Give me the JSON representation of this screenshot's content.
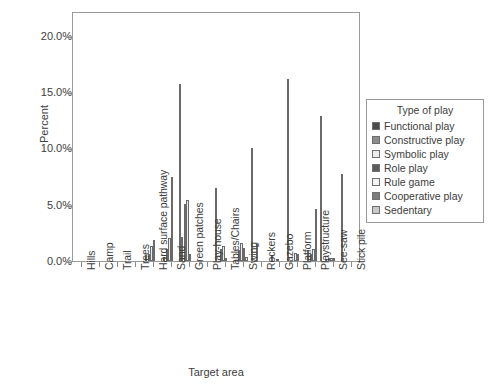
{
  "chart_data": {
    "type": "bar",
    "title": "",
    "xlabel": "Target area",
    "ylabel": "Percent",
    "ylim": [
      0,
      22.2
    ],
    "ytick_values": [
      0,
      5,
      10,
      15,
      20
    ],
    "ytick_labels": [
      "0.0%",
      "5.0%",
      "10.0%",
      "15.0%",
      "20.0%"
    ],
    "grid": false,
    "legend_position": "right-outside",
    "legend_title": "Type of play",
    "categories": [
      "Hills",
      "Camp",
      "Trail",
      "Trees",
      "Hard surface pathway",
      "Sand",
      "Green patches",
      "Play-house",
      "Tables/Chairs",
      "Swing",
      "Rockers",
      "Gazebo",
      "Platform",
      "Playstructure",
      "See-saw",
      "Stick pile"
    ],
    "series": [
      {
        "name": "Functional play",
        "color": "#4b4b4b",
        "values": [
          0,
          0,
          0,
          0,
          0.5,
          0.4,
          2.1,
          0,
          0,
          0,
          0,
          0.5,
          0,
          1.0,
          0.2,
          0
        ]
      },
      {
        "name": "Constructive play",
        "color": "#8c8c8c",
        "values": [
          0,
          0,
          0,
          0,
          0.6,
          1.1,
          5.1,
          0,
          1.1,
          1.0,
          1.5,
          0,
          0,
          0.6,
          0.3,
          0
        ]
      },
      {
        "name": "Symbolic play",
        "color": "#ededed",
        "values": [
          0,
          0,
          0,
          0,
          1.3,
          2.0,
          5.4,
          0,
          1.3,
          1.6,
          0,
          0.1,
          0.7,
          1.1,
          0.3,
          0
        ]
      },
      {
        "name": "Role play",
        "color": "#5a5a5a",
        "values": [
          0,
          0,
          0,
          0,
          1.9,
          7.5,
          0.6,
          0,
          0.3,
          1.2,
          0,
          0,
          0.6,
          4.6,
          0.3,
          0
        ]
      },
      {
        "name": "Rule game",
        "color": "#f4f4f4",
        "values": [
          0,
          0,
          0,
          0,
          0,
          0,
          0,
          0,
          0,
          0.4,
          0,
          0,
          0,
          0,
          0,
          0
        ]
      },
      {
        "name": "Cooperative play",
        "color": "#7d7d7d",
        "values": [
          0,
          0,
          0,
          0,
          0,
          0,
          0,
          0,
          0,
          0,
          0,
          0,
          0,
          12.9,
          0,
          0
        ]
      },
      {
        "name": "Sedentary",
        "color": "#c9c9c9",
        "values": [
          0,
          0,
          0,
          0,
          0,
          15.7,
          0,
          6.5,
          0,
          10.0,
          0,
          16.2,
          0,
          0,
          7.7,
          0.2
        ]
      }
    ]
  }
}
